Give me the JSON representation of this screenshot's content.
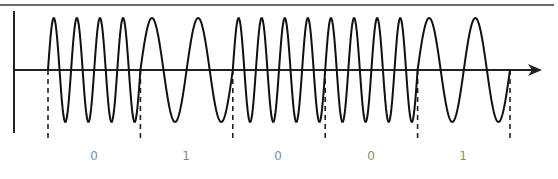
{
  "diagram": {
    "type": "fsk-modulation",
    "bits": [
      "0",
      "1",
      "0",
      "0",
      "1"
    ],
    "cycles_per_bit": {
      "0": 4,
      "1": 2
    },
    "colors": {
      "wave": "#111111",
      "axis": "#222222",
      "border": "#6b6b6b",
      "label": "#8a8a8a"
    }
  },
  "layout": {
    "top_border": {
      "x1": 0,
      "x2": 554,
      "y": 5
    },
    "y_axis": {
      "x": 14,
      "y1": 11,
      "y2": 133
    },
    "x_axis": {
      "x1": 14,
      "x2": 542,
      "y": 70
    },
    "bit_start_x": 48,
    "bit_width": 92.4,
    "amplitude": 52,
    "dash_bottom_y": 138,
    "label_centers_x": [
      94,
      186,
      278,
      371,
      463
    ]
  }
}
